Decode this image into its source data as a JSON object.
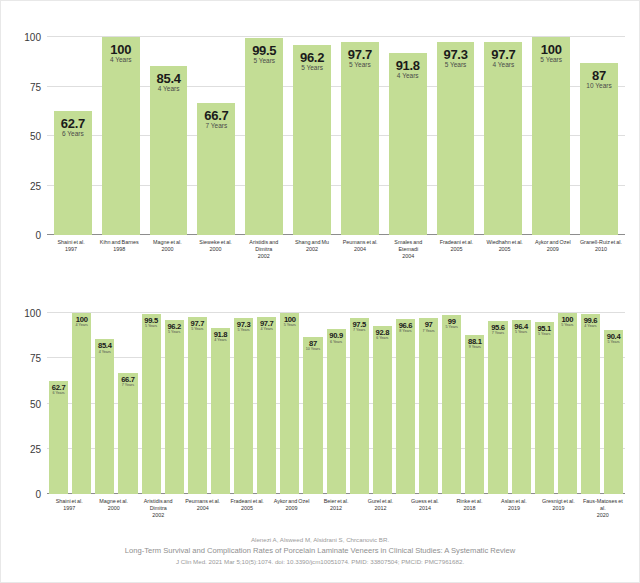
{
  "figure": {
    "background_color": "#ffffff",
    "bar_color": "#c3dd95",
    "gridline_color": "#dedede",
    "axis_color": "#8d8d8d"
  },
  "caption": {
    "authors": "Alenezi A, Alsweed M, Alsidrani S, Chrcanovic BR.",
    "title": "Long-Term Survival and Complication Rates of Porcelain Laminate Veneers in Clinical Studies: A Systematic Review",
    "journal": "J Clin Med. 2021 Mar 5;10(5):1074. doi: 10.3390/jcm10051074. PMID: 33807504; PMCID: PMC7961682."
  },
  "chart_data": [
    {
      "id": "chart1",
      "type": "bar",
      "title": "",
      "xlabel": "",
      "ylabel": "",
      "ylim": [
        0,
        100
      ],
      "yticks": [
        0,
        25,
        50,
        75,
        100
      ],
      "ytick_labels": [
        "0",
        "25",
        "50",
        "75",
        "100"
      ],
      "grid": true,
      "legend": "none",
      "categories": [
        "Shaini et al. 1997",
        "Kihn and Barnes 1998",
        "Magne et al. 2000",
        "Sieweke et al. 2000",
        "Aristidis and Dimitra 2002",
        "Shang and Mu 2002",
        "Peumans et al. 2004",
        "Smales and Etemadi 2004",
        "Fradeani et al. 2005",
        "Wiedhahn et al. 2005",
        "Aykor and Ozel 2009",
        "Granell-Ruiz et al. 2010"
      ],
      "values": [
        62.7,
        100,
        85.4,
        66.7,
        99.5,
        96.2,
        97.7,
        91.8,
        97.3,
        97.7,
        100,
        87
      ],
      "bars": [
        {
          "name": "Shaini et al.",
          "year": "1997",
          "value": "62.7",
          "followup": "6 Years"
        },
        {
          "name": "Kihn and Barnes",
          "year": "1998",
          "value": "100",
          "followup": "4 Years"
        },
        {
          "name": "Magne et al.",
          "year": "2000",
          "value": "85.4",
          "followup": "4 Years"
        },
        {
          "name": "Sieweke et al.",
          "year": "2000",
          "value": "66.7",
          "followup": "7 Years"
        },
        {
          "name": "Aristidis and Dimitra",
          "year": "2002",
          "value": "99.5",
          "followup": "5 Years"
        },
        {
          "name": "Shang and Mu",
          "year": "2002",
          "value": "96.2",
          "followup": "5 Years"
        },
        {
          "name": "Peumans et al.",
          "year": "2004",
          "value": "97.7",
          "followup": "5 Years"
        },
        {
          "name": "Smales and Etemadi",
          "year": "2004",
          "value": "91.8",
          "followup": "4 Years"
        },
        {
          "name": "Fradeani et al.",
          "year": "2005",
          "value": "97.3",
          "followup": "5 Years"
        },
        {
          "name": "Wiedhahn et al.",
          "year": "2005",
          "value": "97.7",
          "followup": "4 Years"
        },
        {
          "name": "Aykor and Ozel",
          "year": "2009",
          "value": "100",
          "followup": "5 Years"
        },
        {
          "name": "Granell-Ruiz et al.",
          "year": "2010",
          "value": "87",
          "followup": "10 Years"
        }
      ]
    },
    {
      "id": "chart2",
      "type": "bar",
      "title": "",
      "xlabel": "",
      "ylabel": "",
      "ylim": [
        0,
        100
      ],
      "yticks": [
        0,
        25,
        50,
        75,
        100
      ],
      "ytick_labels": [
        "0",
        "25",
        "50",
        "75",
        "100"
      ],
      "grid": true,
      "legend": "none",
      "categories": [
        "Shaini et al. 1997",
        "",
        "Magne et al. 2000",
        "",
        "Aristidis and Dimitra 2002",
        "",
        "Peumans et al. 2004",
        "",
        "Fradeani et al. 2005",
        "",
        "Aykor and Ozel 2009",
        "",
        "Beier et al. 2012",
        "",
        "Gurel et al. 2012",
        "",
        "Guess et al. 2014",
        "",
        "Rinke et al. 2018",
        "",
        "Aslan et al. 2019",
        "",
        "Gresnigt et al. 2019",
        "Faus-Matoses et al. 2020"
      ],
      "values": [
        62.7,
        100,
        85.4,
        66.7,
        99.5,
        96.2,
        97.7,
        91.8,
        97.3,
        97.7,
        100,
        87,
        90.9,
        97.5,
        92.8,
        96.6,
        97,
        99,
        88.1,
        95.6,
        96.4,
        95.1,
        100,
        99.6,
        90.4
      ],
      "bars": [
        {
          "value": "62.7",
          "followup": "6 Years",
          "name": "Shaini et al.",
          "year": "1997"
        },
        {
          "value": "100",
          "followup": "4 Years",
          "name": "",
          "year": ""
        },
        {
          "value": "85.4",
          "followup": "4 Years",
          "name": "Magne et al.",
          "year": "2000"
        },
        {
          "value": "66.7",
          "followup": "7 Years",
          "name": "",
          "year": ""
        },
        {
          "value": "99.5",
          "followup": "5 Years",
          "name": "Aristidis and Dimitra",
          "year": "2002"
        },
        {
          "value": "96.2",
          "followup": "5 Years",
          "name": "",
          "year": ""
        },
        {
          "value": "97.7",
          "followup": "5 Years",
          "name": "Peumans et al.",
          "year": "2004"
        },
        {
          "value": "91.8",
          "followup": "4 Years",
          "name": "",
          "year": ""
        },
        {
          "value": "97.3",
          "followup": "5 Years",
          "name": "Fradeani et al.",
          "year": "2005"
        },
        {
          "value": "97.7",
          "followup": "4 Years",
          "name": "",
          "year": ""
        },
        {
          "value": "100",
          "followup": "5 Years",
          "name": "Aykor and Ozel",
          "year": "2009"
        },
        {
          "value": "87",
          "followup": "10 Years",
          "name": "",
          "year": ""
        },
        {
          "value": "90.9",
          "followup": "6 Years",
          "name": "Beier et al.",
          "year": "2012"
        },
        {
          "value": "97.5",
          "followup": "7 Years",
          "name": "",
          "year": ""
        },
        {
          "value": "92.8",
          "followup": "6 Years",
          "name": "Gurel et al.",
          "year": "2012"
        },
        {
          "value": "96.6",
          "followup": "8 Years",
          "name": "",
          "year": ""
        },
        {
          "value": "97",
          "followup": "7 Years",
          "name": "Guess et al.",
          "year": "2014"
        },
        {
          "value": "99",
          "followup": "5 Years",
          "name": "",
          "year": ""
        },
        {
          "value": "88.1",
          "followup": "9 Years",
          "name": "Rinke et al.",
          "year": "2018"
        },
        {
          "value": "95.6",
          "followup": "7 Years",
          "name": "",
          "year": ""
        },
        {
          "value": "96.4",
          "followup": "5 Years",
          "name": "Aslan et al.",
          "year": "2019"
        },
        {
          "value": "95.1",
          "followup": "5 Years",
          "name": "",
          "year": ""
        },
        {
          "value": "100",
          "followup": "5 Years",
          "name": "Gresnigt et al.",
          "year": "2019"
        },
        {
          "value": "99.6",
          "followup": "4 Years",
          "name": "",
          "year": ""
        },
        {
          "value": "90.4",
          "followup": "5 Years",
          "name": "Faus-Matoses et al.",
          "year": "2020"
        }
      ],
      "xlabels": [
        {
          "name": "Shaini et al.",
          "year": "1997"
        },
        {
          "name": "Magne et al.",
          "year": "2000"
        },
        {
          "name": "Aristidis and Dimitra",
          "year": "2002"
        },
        {
          "name": "Peumans et al.",
          "year": "2004"
        },
        {
          "name": "Fradeani et al.",
          "year": "2005"
        },
        {
          "name": "Aykor and Ozel",
          "year": "2009"
        },
        {
          "name": "Beier et al.",
          "year": "2012"
        },
        {
          "name": "Gurel et al.",
          "year": "2012"
        },
        {
          "name": "Guess et al.",
          "year": "2014"
        },
        {
          "name": "Rinke et al.",
          "year": "2018"
        },
        {
          "name": "Aslan et al.",
          "year": "2019"
        },
        {
          "name": "Gresnigt et al.",
          "year": "2019"
        },
        {
          "name": "Faus-Matoses et al.",
          "year": "2020"
        }
      ]
    }
  ]
}
